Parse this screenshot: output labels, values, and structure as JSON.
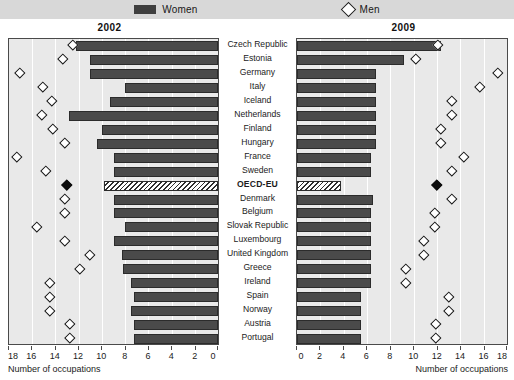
{
  "legend": {
    "women_label": "Women",
    "men_label": "Men",
    "women_icon": "bar-swatch-icon",
    "men_icon": "diamond-swatch-icon"
  },
  "panels": {
    "left_year": "2002",
    "right_year": "2009"
  },
  "axis": {
    "title": "Number of occupations",
    "left_ticks": [
      "18",
      "16",
      "14",
      "12",
      "10",
      "8",
      "6",
      "4",
      "2",
      "0"
    ],
    "right_ticks": [
      "0",
      "2",
      "4",
      "6",
      "8",
      "10",
      "12",
      "14",
      "16",
      "18"
    ],
    "min": 0,
    "max": 18
  },
  "chart_data": {
    "type": "bar",
    "xlabel": "Number of occupations",
    "ylabel": "",
    "xlim": [
      0,
      18
    ],
    "grid": true,
    "legend_position": "top-center",
    "panels": [
      "2002",
      "2009"
    ],
    "categories": [
      "Czech Republic",
      "Estonia",
      "Germany",
      "Italy",
      "Iceland",
      "Netherlands",
      "Finland",
      "Hungary",
      "France",
      "Sweden",
      "OECD-EU",
      "Denmark",
      "Belgium",
      "Slovak Republic",
      "Luxembourg",
      "United Kingdom",
      "Greece",
      "Ireland",
      "Spain",
      "Norway",
      "Austria",
      "Portugal"
    ],
    "series": [
      {
        "name": "Women",
        "panel": "2002",
        "type": "bar",
        "direction": "right-to-left",
        "values": [
          12.2,
          11.0,
          11.0,
          8.0,
          9.3,
          12.8,
          10.0,
          10.4,
          9.0,
          9.0,
          9.8,
          9.0,
          9.0,
          8.0,
          9.0,
          8.3,
          8.2,
          7.5,
          7.2,
          7.5,
          7.2,
          7.2
        ]
      },
      {
        "name": "Men",
        "panel": "2002",
        "type": "diamond",
        "values": [
          12.5,
          13.4,
          17.1,
          15.1,
          14.3,
          15.2,
          14.2,
          13.2,
          17.3,
          14.8,
          13.0,
          13.2,
          13.2,
          15.6,
          13.2,
          11.0,
          11.9,
          14.5,
          14.5,
          14.5,
          12.8,
          12.8
        ]
      },
      {
        "name": "Women",
        "panel": "2009",
        "type": "bar",
        "direction": "left-to-right",
        "values": [
          12.3,
          9.2,
          6.8,
          6.8,
          6.8,
          6.8,
          6.8,
          6.8,
          6.3,
          6.3,
          3.8,
          6.5,
          6.3,
          6.3,
          6.3,
          6.3,
          6.3,
          6.3,
          5.5,
          5.5,
          5.5,
          5.5
        ]
      },
      {
        "name": "Men",
        "panel": "2009",
        "type": "diamond",
        "values": [
          12.1,
          10.2,
          17.2,
          15.7,
          13.3,
          13.3,
          12.3,
          12.3,
          14.3,
          13.3,
          12.0,
          13.3,
          11.8,
          11.8,
          10.9,
          10.9,
          9.3,
          9.3,
          13.0,
          13.0,
          11.9,
          11.9
        ]
      }
    ],
    "highlight_row": "OECD-EU",
    "highlight_style": {
      "bar": "hatched",
      "diamond": "filled-black"
    }
  }
}
